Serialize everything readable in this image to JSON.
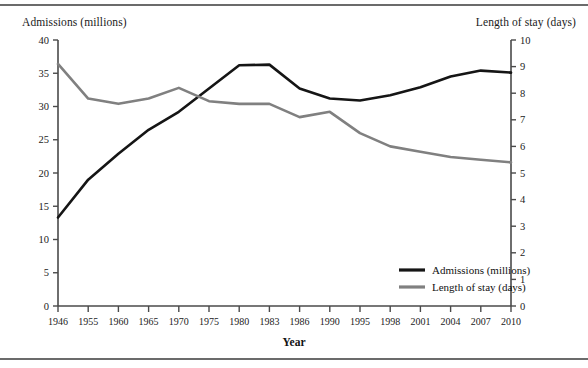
{
  "figure": {
    "left_axis_title": "Admissions (millions)",
    "right_axis_title": "Length of stay (days)",
    "x_axis_title": "Year"
  },
  "legend": {
    "position": "inside-bottom-right",
    "entries": [
      {
        "label": "Admissions (millions)",
        "color": "#151515"
      },
      {
        "label": "Length of stay (days)",
        "color": "#808080"
      }
    ]
  },
  "chart_data": {
    "type": "line",
    "title": "",
    "xlabel": "Year",
    "ylabel": "Admissions (millions)",
    "y2label": "Length of stay (days)",
    "grid": false,
    "legend_position": "inside-bottom-right",
    "categories": [
      "1946",
      "1955",
      "1960",
      "1965",
      "1970",
      "1975",
      "1980",
      "1983",
      "1986",
      "1990",
      "1995",
      "1998",
      "2001",
      "2004",
      "2007",
      "2010"
    ],
    "ylim": [
      0,
      40
    ],
    "yticks": [
      0,
      5,
      10,
      15,
      20,
      25,
      30,
      35,
      40
    ],
    "y2lim": [
      0,
      10
    ],
    "y2ticks": [
      0,
      1,
      2,
      3,
      4,
      5,
      6,
      7,
      8,
      9,
      10
    ],
    "series": [
      {
        "name": "Admissions (millions)",
        "axis": "left",
        "color": "#151515",
        "width": 2.6,
        "values": [
          13.3,
          19.0,
          22.9,
          26.5,
          29.2,
          32.7,
          36.2,
          36.3,
          32.7,
          31.2,
          30.9,
          31.7,
          32.9,
          34.5,
          35.4,
          35.1
        ]
      },
      {
        "name": "Length of stay (days)",
        "axis": "right",
        "color": "#808080",
        "width": 2.6,
        "values": [
          9.1,
          7.8,
          7.6,
          7.8,
          8.2,
          7.7,
          7.6,
          7.6,
          7.1,
          7.3,
          6.5,
          6.0,
          5.8,
          5.6,
          5.5,
          5.4
        ]
      }
    ]
  },
  "plot_geometry": {
    "x0": 58,
    "x1": 511,
    "y_top": 40,
    "y_bottom": 306
  }
}
